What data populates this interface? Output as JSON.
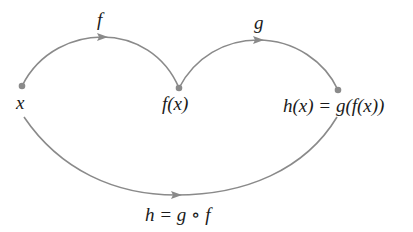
{
  "diagram": {
    "type": "function-composition",
    "colors": {
      "curve": "#8a8a8a",
      "dot": "#8a8a8a",
      "text": "#1a1a1a",
      "background": "#ffffff"
    },
    "nodes": [
      {
        "id": "x",
        "label": "x"
      },
      {
        "id": "fx",
        "label": "f(x)"
      },
      {
        "id": "hx",
        "label": "h(x) = g(f(x))"
      }
    ],
    "edges": [
      {
        "from": "x",
        "to": "fx",
        "label": "f"
      },
      {
        "from": "fx",
        "to": "hx",
        "label": "g"
      },
      {
        "from": "x",
        "to": "hx",
        "label": "h = g ∘ f"
      }
    ]
  }
}
